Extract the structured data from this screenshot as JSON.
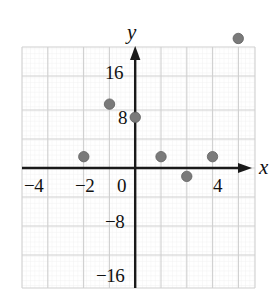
{
  "chart_data": {
    "type": "scatter",
    "title": "",
    "xlabel": "x",
    "ylabel": "y",
    "xlim": [
      -4.4,
      4.65
    ],
    "ylim": [
      -20.0,
      16.7
    ],
    "grid": true,
    "grid_minor": true,
    "legend": "none",
    "x_ticks": [
      -4,
      -2,
      0,
      4
    ],
    "x_tick_labels": [
      "−4",
      "−2",
      "0",
      "4"
    ],
    "y_ticks": [
      16,
      8,
      -8,
      -16
    ],
    "y_tick_labels": [
      "16",
      "8",
      "−8",
      "−16"
    ],
    "x_major_step": 1,
    "y_major_step": 4,
    "point_color": "#7a7a7a",
    "point_edge_color": "#5e5e5e",
    "axis_color": "#1a1a1a",
    "grid_color": "#d8d8d8",
    "points": [
      {
        "x": -2,
        "y": 0
      },
      {
        "x": -1,
        "y": 8
      },
      {
        "x": 0,
        "y": 6
      },
      {
        "x": 1,
        "y": 0
      },
      {
        "x": 2,
        "y": -3
      },
      {
        "x": 3,
        "y": 0
      },
      {
        "x": 4,
        "y": 18
      }
    ],
    "values": [
      0,
      8,
      6,
      0,
      -3,
      0,
      18
    ],
    "categories": [
      -2,
      -1,
      0,
      1,
      2,
      3,
      4
    ]
  },
  "axis_labels": {
    "x": "x",
    "y": "y"
  },
  "ticks": {
    "x": [
      {
        "label": "−4",
        "left": 24,
        "top": 176
      },
      {
        "label": "−2",
        "left": 75,
        "top": 176
      },
      {
        "label": "0",
        "left": 117,
        "top": 176
      },
      {
        "label": "4",
        "left": 213,
        "top": 176
      }
    ],
    "y": [
      {
        "label": "16",
        "left": 105,
        "top": 63
      },
      {
        "label": "8",
        "left": 118,
        "top": 108
      },
      {
        "label": "−8",
        "left": 105,
        "top": 212
      },
      {
        "label": "−16",
        "left": 96,
        "top": 266
      }
    ]
  }
}
